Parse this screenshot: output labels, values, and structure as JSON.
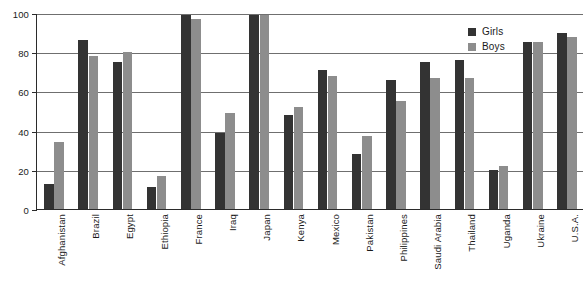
{
  "chart_data": {
    "type": "bar",
    "title": "",
    "subtitle": "",
    "xlabel": "",
    "ylabel": "",
    "ylim": [
      0,
      100
    ],
    "yticks": [
      0,
      20,
      40,
      60,
      80,
      100
    ],
    "ytick_labels": [
      "0",
      "20",
      "40",
      "60",
      "80",
      "100"
    ],
    "grid": true,
    "legend_position": "top-right",
    "categories": [
      "Afghanistan",
      "Brazil",
      "Egypt",
      "Ethiopia",
      "France",
      "Iraq",
      "Japan",
      "Kenya",
      "Mexico",
      "Pakistan",
      "Philippines",
      "Saudi Arabia",
      "Thailand",
      "Uganda",
      "Ukraine",
      "U.S.A."
    ],
    "series": [
      {
        "name": "Girls",
        "color": "#333333",
        "values": [
          13,
          86,
          75,
          11,
          99,
          39,
          99,
          48,
          71,
          28,
          66,
          75,
          76,
          20,
          85,
          90
        ]
      },
      {
        "name": "Boys",
        "color": "#8d8d8d",
        "values": [
          34,
          78,
          80,
          17,
          97,
          49,
          99,
          52,
          68,
          37,
          55,
          67,
          67,
          22,
          85,
          88
        ]
      }
    ]
  },
  "legend": {
    "items": [
      {
        "label": "Girls",
        "color": "#333333"
      },
      {
        "label": "Boys",
        "color": "#8d8d8d"
      }
    ]
  },
  "axis_colors": {
    "axis_line": "#2b2b2b",
    "gridline": "#6f6f6f",
    "text": "#1a1a1a"
  }
}
